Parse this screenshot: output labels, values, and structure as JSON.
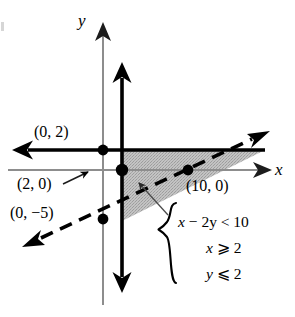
{
  "figure": {
    "kind": "coordinate-plane-graph",
    "axis_labels": {
      "x": "x",
      "y": "y"
    },
    "colors": {
      "ink": "#000000",
      "axis": "#8a8a8a",
      "shading": "#b9b9b9",
      "background": "#ffffff",
      "leader": "#4a4a4a"
    },
    "point_labels": [
      {
        "id": "p02",
        "text": "(0, 2)"
      },
      {
        "id": "p20",
        "text": "(2, 0)"
      },
      {
        "id": "p0m5",
        "text": "(0, −5)"
      },
      {
        "id": "p100",
        "text": "(10, 0)"
      }
    ],
    "system": {
      "brace": "{",
      "inequalities": [
        {
          "id": "ineq-1",
          "text": "x − 2y < 10"
        },
        {
          "id": "ineq-2",
          "text": "x ⩾ 2"
        },
        {
          "id": "ineq-3",
          "text": "y ⩽ 2"
        }
      ]
    }
  },
  "chart_data": {
    "type": "scatter",
    "title": "",
    "xlabel": "x",
    "ylabel": "y",
    "grid": false,
    "legend": "none",
    "xlim": [
      -8,
      14
    ],
    "ylim": [
      -9,
      7
    ],
    "annotations": [
      "x − 2y < 10",
      "x ⩾ 2",
      "y ⩽ 2"
    ],
    "points": [
      {
        "label": "(0, 2)",
        "x": 0,
        "y": 2,
        "marker": "filled-circle"
      },
      {
        "label": "(2, 0)",
        "x": 2,
        "y": 0,
        "marker": "filled-circle"
      },
      {
        "label": "(10, 0)",
        "x": 10,
        "y": 0,
        "marker": "filled-circle"
      },
      {
        "label": "(0, -5)",
        "x": 0,
        "y": -5,
        "marker": "filled-circle"
      }
    ],
    "boundary_lines": [
      {
        "name": "y = 2",
        "equation": "y = 2",
        "style": "solid",
        "inequality": "y ⩽ 2",
        "arrows": [
          "left"
        ]
      },
      {
        "name": "x = 2",
        "equation": "x = 2",
        "style": "solid",
        "inequality": "x ⩾ 2",
        "arrows": [
          "up",
          "down"
        ]
      },
      {
        "name": "x - 2y = 10",
        "equation": "x − 2y = 10",
        "style": "dashed",
        "inequality": "x − 2y < 10",
        "arrows": [
          "lower-left",
          "upper-right"
        ],
        "x_intercept": 10,
        "y_intercept": -5,
        "slope": 0.5
      }
    ],
    "shaded_region": {
      "description": "Triangular solution region bounded by x = 2 on the left, y = 2 on top, and the dashed line x − 2y = 10 on the lower right",
      "fill": "#b9b9b9",
      "vertices": [
        {
          "x": 2,
          "y": 2
        },
        {
          "x": 14,
          "y": 2
        },
        {
          "x": 2,
          "y": -4
        }
      ]
    }
  }
}
